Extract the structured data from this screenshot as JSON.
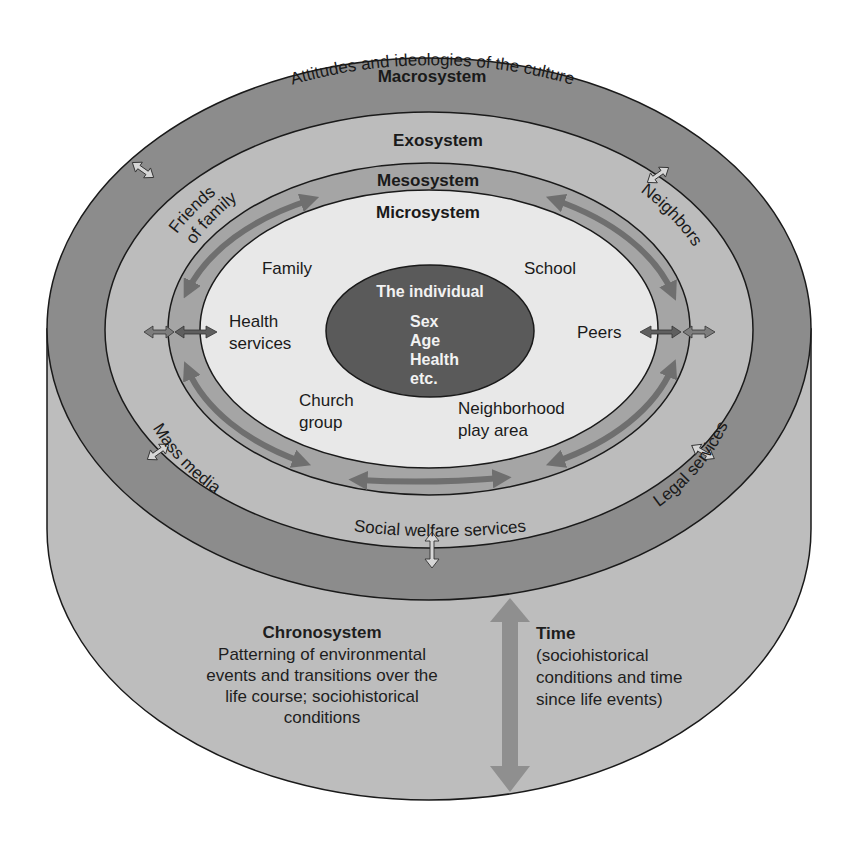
{
  "diagram": {
    "colors": {
      "background": "#ffffff",
      "cylinder_side": "#bdbdbd",
      "macrosystem": "#8c8c8c",
      "exosystem": "#bcbcbc",
      "mesosystem": "#a5a5a5",
      "microsystem": "#e8e8e8",
      "individual": "#5a5a5a",
      "outline": "#1a1a1a",
      "arrow_dark": "#6f6f6f",
      "arrow_light": "#a8a8a8"
    },
    "macrosystem": {
      "title": "Macrosystem",
      "subtitle": "Attitudes and ideologies of the culture"
    },
    "exosystem": {
      "title": "Exosystem",
      "items": {
        "friends": "Friends",
        "of_family": "of family",
        "neighbors": "Neighbors",
        "mass_media": "Mass media",
        "legal_services": "Legal services",
        "social_welfare": "Social welfare services"
      }
    },
    "mesosystem": {
      "title": "Mesosystem"
    },
    "microsystem": {
      "title": "Microsystem",
      "items": {
        "family": "Family",
        "school": "School",
        "health_1": "Health",
        "health_2": "services",
        "peers": "Peers",
        "church_1": "Church",
        "church_2": "group",
        "neighborhood_1": "Neighborhood",
        "neighborhood_2": "play area"
      }
    },
    "individual": {
      "title": "The individual",
      "attributes": [
        "Sex",
        "Age",
        "Health",
        "etc."
      ]
    },
    "chronosystem": {
      "title": "Chronosystem",
      "description_lines": [
        "Patterning of environmental",
        "events and transitions over the",
        "life course; sociohistorical",
        "conditions"
      ]
    },
    "time": {
      "title": "Time",
      "description_lines": [
        "(sociohistorical",
        "conditions and time",
        "since life events)"
      ]
    }
  }
}
